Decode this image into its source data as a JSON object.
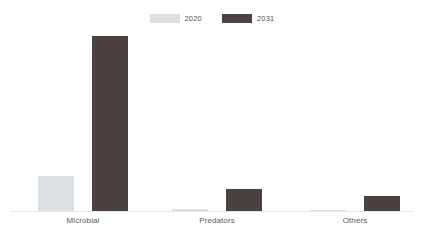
{
  "chart_data": {
    "type": "bar",
    "title": "",
    "subtitle": "",
    "xlabel": "",
    "ylabel": "",
    "categories": [
      "Microbial",
      "Predators",
      "Others"
    ],
    "series": [
      {
        "name": "2020",
        "color": "#dcdfe1",
        "values": [
          20,
          1.1,
          0.5
        ]
      },
      {
        "name": "2031",
        "color": "#4a4140",
        "values": [
          100,
          12.6,
          8.6
        ]
      }
    ],
    "ylim": [
      0,
      100
    ],
    "grid": false,
    "legend_position": "top-center",
    "axis_line_color": "#e6e7e8",
    "background": "#ffffff"
  },
  "legend": {
    "entries": [
      {
        "label": "2020",
        "color": "#dcdfe1"
      },
      {
        "label": "2031",
        "color": "#4a4140"
      }
    ]
  },
  "axis": {
    "categories": [
      {
        "label": "Microbial"
      },
      {
        "label": "Predators"
      },
      {
        "label": "Others"
      }
    ]
  }
}
